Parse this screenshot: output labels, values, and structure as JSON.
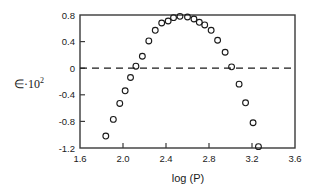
{
  "chart_data": {
    "type": "scatter",
    "title": "",
    "subtitle": "",
    "xlabel": "log  (P)",
    "ylabel": "∈·10",
    "ylabel_exponent": "2",
    "ylabel_full": "∈·10²",
    "xlim": [
      1.6,
      3.6
    ],
    "ylim": [
      -1.2,
      0.8
    ],
    "xticks": [
      1.6,
      2.0,
      2.4,
      2.8,
      3.2,
      3.6
    ],
    "xtick_labels": [
      "1.6",
      "2.0",
      "2.4",
      "2.8",
      "3.2",
      "3.6"
    ],
    "yticks": [
      0.8,
      0.4,
      0,
      -0.4,
      -0.8,
      -1.2
    ],
    "ytick_labels": [
      "0.8",
      "0.4",
      "0",
      "-0.4",
      "-0.8",
      "-1.2"
    ],
    "grid": false,
    "legend": null,
    "marker": "open-circle",
    "marker_color": "#1a1a1a",
    "reference_lines": [
      {
        "axis": "y",
        "value": 0,
        "style": "dashed",
        "color": "#1a1a1a"
      }
    ],
    "x": [
      1.84,
      1.91,
      1.97,
      2.02,
      2.07,
      2.12,
      2.18,
      2.24,
      2.3,
      2.36,
      2.42,
      2.47,
      2.53,
      2.6,
      2.66,
      2.71,
      2.76,
      2.82,
      2.88,
      2.95,
      3.01,
      3.08,
      3.14,
      3.21,
      3.26
    ],
    "y": [
      -1.02,
      -0.77,
      -0.53,
      -0.34,
      -0.14,
      0.03,
      0.18,
      0.41,
      0.57,
      0.68,
      0.71,
      0.76,
      0.78,
      0.77,
      0.74,
      0.69,
      0.65,
      0.57,
      0.42,
      0.24,
      0.02,
      -0.24,
      -0.52,
      -0.82,
      -1.18
    ],
    "points": [
      {
        "x": 1.84,
        "y": -1.02
      },
      {
        "x": 1.91,
        "y": -0.77
      },
      {
        "x": 1.97,
        "y": -0.53
      },
      {
        "x": 2.02,
        "y": -0.34
      },
      {
        "x": 2.07,
        "y": -0.14
      },
      {
        "x": 2.12,
        "y": 0.03
      },
      {
        "x": 2.18,
        "y": 0.18
      },
      {
        "x": 2.24,
        "y": 0.41
      },
      {
        "x": 2.3,
        "y": 0.57
      },
      {
        "x": 2.36,
        "y": 0.68
      },
      {
        "x": 2.42,
        "y": 0.71
      },
      {
        "x": 2.47,
        "y": 0.76
      },
      {
        "x": 2.53,
        "y": 0.78
      },
      {
        "x": 2.6,
        "y": 0.77
      },
      {
        "x": 2.66,
        "y": 0.74
      },
      {
        "x": 2.71,
        "y": 0.69
      },
      {
        "x": 2.76,
        "y": 0.65
      },
      {
        "x": 2.82,
        "y": 0.57
      },
      {
        "x": 2.88,
        "y": 0.42
      },
      {
        "x": 2.95,
        "y": 0.24
      },
      {
        "x": 3.01,
        "y": 0.02
      },
      {
        "x": 3.08,
        "y": -0.24
      },
      {
        "x": 3.14,
        "y": -0.52
      },
      {
        "x": 3.21,
        "y": -0.82
      },
      {
        "x": 3.26,
        "y": -1.18
      }
    ]
  }
}
